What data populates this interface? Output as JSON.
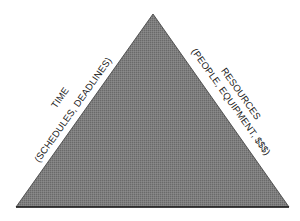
{
  "diagram": {
    "type": "project-triangle",
    "colors": {
      "fill": "#7a7a7a",
      "fill_dark": "#5e5e5e",
      "edge": "#2a2a2a",
      "background": "#ffffff",
      "text": "#1a1a1a"
    },
    "left_side": {
      "title": "TIME",
      "subtitle": "(SCHEDULES, DEADLINES)"
    },
    "right_side": {
      "title": "RESOURCES",
      "subtitle": "(PEOPLE, EQUIPMENT, $$$)"
    },
    "bottom_side": {
      "title": ""
    }
  }
}
